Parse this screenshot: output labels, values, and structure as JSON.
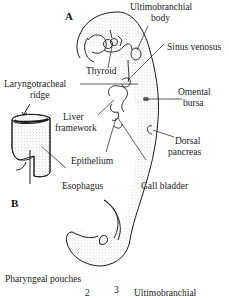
{
  "figure": {
    "panels": {
      "a": "A",
      "b": "B"
    },
    "labels": {
      "ultimobranchial_1": "Ultimobranchial",
      "ultimobranchial_2": "body",
      "sinus_venosus": "Sinus venosus",
      "thyroid": "Thyroid",
      "laryngotracheal_1": "Laryngotracheal",
      "laryngotracheal_2": "ridge",
      "omental_1": "Omental",
      "omental_2": "bursa",
      "liver_1": "Liver",
      "liver_2": "framework",
      "dorsal_1": "Dorsal",
      "dorsal_2": "pancreas",
      "epithelium": "Epithelium",
      "esophagus": "Esophagus",
      "gall_bladder": "Gall bladder"
    },
    "bottom": {
      "pharyngeal_pouches": "Pharyngeal pouches",
      "pouch_2": "2",
      "pouch_3": "3",
      "ultimobranchial": "Ultimobranchial"
    },
    "colors": {
      "ink": "#1a1a1a",
      "stipple": "#9a9a9a"
    }
  }
}
